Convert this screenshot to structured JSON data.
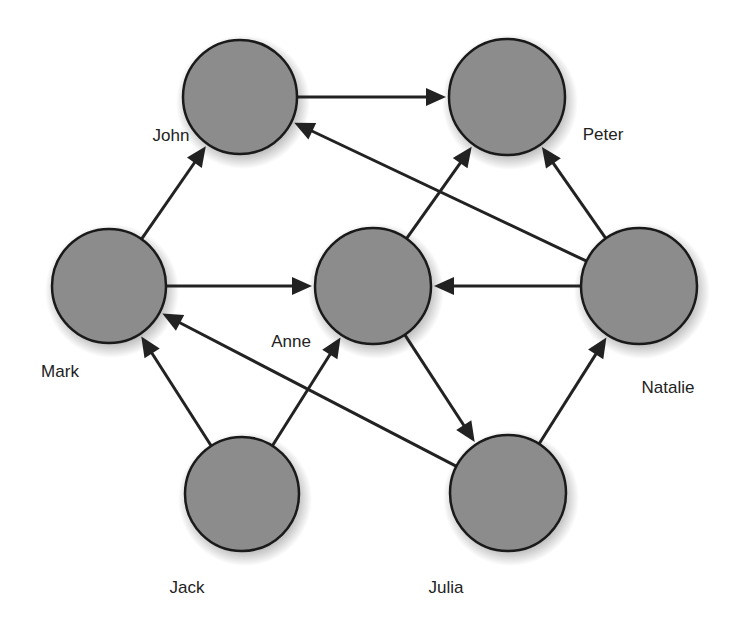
{
  "diagram": {
    "type": "directed-graph",
    "colors": {
      "node_fill": "#8c8c8c",
      "node_stroke": "#1a1a1a",
      "edge": "#222222",
      "label": "#222222",
      "background": "#ffffff"
    },
    "nodes": [
      {
        "id": "john",
        "label": "John",
        "cx": 240,
        "cy": 97,
        "r": 57,
        "lx": 171,
        "ly": 141
      },
      {
        "id": "peter",
        "label": "Peter",
        "cx": 507,
        "cy": 97,
        "r": 58,
        "lx": 603,
        "ly": 140
      },
      {
        "id": "mark",
        "label": "Mark",
        "cx": 109,
        "cy": 286,
        "r": 57,
        "lx": 60,
        "ly": 377
      },
      {
        "id": "anne",
        "label": "Anne",
        "cx": 373,
        "cy": 286,
        "r": 58,
        "lx": 291,
        "ly": 347
      },
      {
        "id": "natalie",
        "label": "Natalie",
        "cx": 639,
        "cy": 286,
        "r": 58,
        "lx": 668,
        "ly": 393
      },
      {
        "id": "jack",
        "label": "Jack",
        "cx": 242,
        "cy": 494,
        "r": 57,
        "lx": 187,
        "ly": 593
      },
      {
        "id": "julia",
        "label": "Julia",
        "cx": 508,
        "cy": 493,
        "r": 58,
        "lx": 446,
        "ly": 593
      }
    ],
    "edges": [
      {
        "from": "john",
        "to": "peter"
      },
      {
        "from": "mark",
        "to": "john"
      },
      {
        "from": "mark",
        "to": "anne"
      },
      {
        "from": "anne",
        "to": "peter"
      },
      {
        "from": "anne",
        "to": "julia"
      },
      {
        "from": "natalie",
        "to": "peter"
      },
      {
        "from": "natalie",
        "to": "john"
      },
      {
        "from": "natalie",
        "to": "anne"
      },
      {
        "from": "jack",
        "to": "mark"
      },
      {
        "from": "jack",
        "to": "anne"
      },
      {
        "from": "julia",
        "to": "mark"
      },
      {
        "from": "julia",
        "to": "natalie"
      }
    ]
  }
}
